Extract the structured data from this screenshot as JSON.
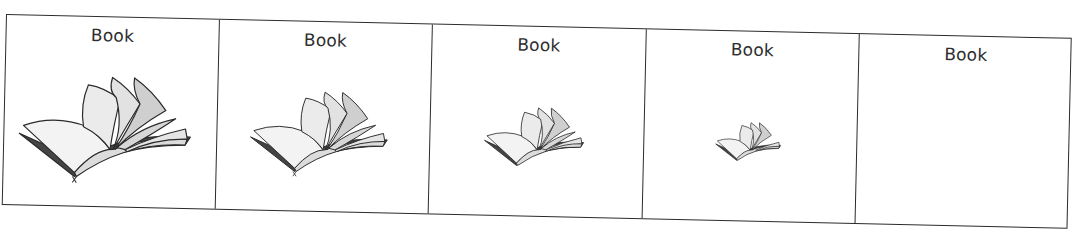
{
  "worksheet": {
    "panels": [
      {
        "label": "Book",
        "image": "open-book-icon",
        "scale": 1.0,
        "width": 213
      },
      {
        "label": "Book",
        "image": "open-book-icon",
        "scale": 0.85,
        "width": 213
      },
      {
        "label": "Book",
        "image": "open-book-icon",
        "scale": 0.62,
        "width": 214
      },
      {
        "label": "Book",
        "image": "open-book-icon",
        "scale": 0.4,
        "width": 213
      },
      {
        "label": "Book",
        "image": null,
        "scale": 0,
        "width": 213
      }
    ]
  },
  "colors": {
    "border": "#2b2b2b",
    "text": "#2e2e2e",
    "page_fill": "#ebebeb",
    "page_shade": "#c9c9c9",
    "background": "#ffffff"
  }
}
